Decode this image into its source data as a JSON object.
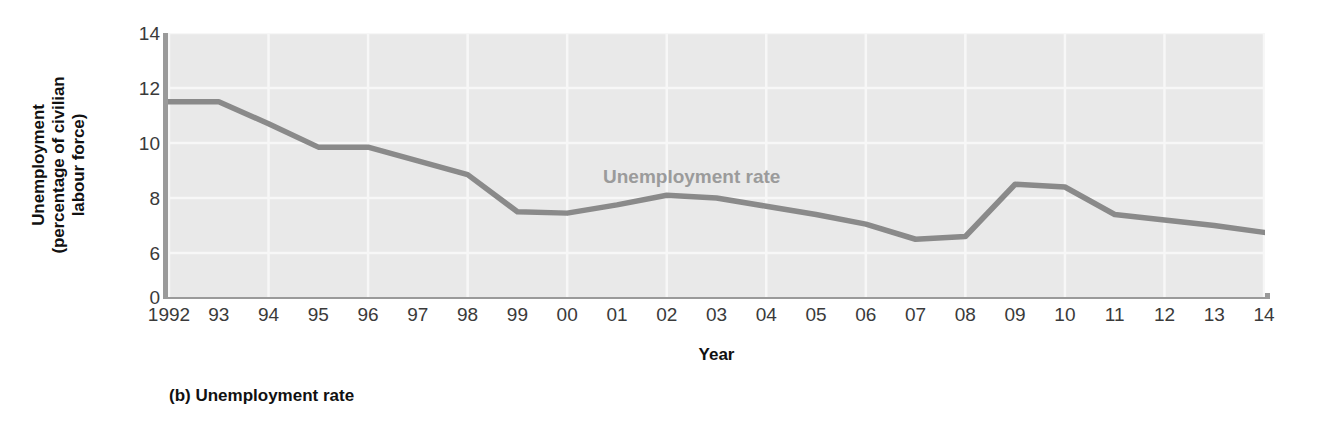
{
  "figure": {
    "caption": "(b) Unemployment rate",
    "series_label": "Unemployment rate",
    "xlabel": "Year",
    "ylabel_line1": "Unemployment",
    "ylabel_line2": "(percentage of civilian",
    "ylabel_line3": "labour force)"
  },
  "colors": {
    "line": "#8a8a8a",
    "plot_background": "#e9e9e9",
    "gridline": "#f7f7f7",
    "axis": "#9a9a9a",
    "tick_text": "#3a3a3a",
    "series_label": "#9b9b9b",
    "title_text": "#111111"
  },
  "chart_data": {
    "type": "line",
    "title": "(b) Unemployment rate",
    "xlabel": "Year",
    "ylabel": "Unemployment (percentage of civilian labour force)",
    "legend": [
      "Unemployment rate"
    ],
    "legend_position": "inside-top-center",
    "grid": true,
    "axis_break": true,
    "ylim": [
      6,
      14
    ],
    "yticks": [
      0,
      6,
      8,
      10,
      12,
      14
    ],
    "ytick_labels": [
      "0",
      "6",
      "8",
      "10",
      "12",
      "14"
    ],
    "x": [
      1992,
      1993,
      1994,
      1995,
      1996,
      1997,
      1998,
      1999,
      2000,
      2001,
      2002,
      2003,
      2004,
      2005,
      2006,
      2007,
      2008,
      2009,
      2010,
      2011,
      2012,
      2013,
      2014
    ],
    "xtick_labels": [
      "1992",
      "93",
      "94",
      "95",
      "96",
      "97",
      "98",
      "99",
      "00",
      "01",
      "02",
      "03",
      "04",
      "05",
      "06",
      "07",
      "08",
      "09",
      "10",
      "11",
      "12",
      "13",
      "14"
    ],
    "series": [
      {
        "name": "Unemployment rate",
        "values": [
          11.5,
          11.5,
          10.7,
          9.85,
          9.85,
          9.35,
          8.85,
          7.5,
          7.45,
          7.75,
          8.1,
          8.0,
          7.7,
          7.4,
          7.05,
          6.5,
          6.6,
          8.5,
          8.4,
          7.4,
          7.2,
          7.0,
          6.75
        ]
      }
    ]
  }
}
